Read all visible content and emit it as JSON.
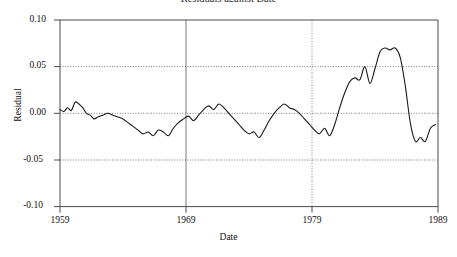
{
  "chart_data": {
    "type": "line",
    "title": "Residuals against Date",
    "xlabel": "Date",
    "ylabel": "Residual",
    "xlim": [
      1959,
      1989
    ],
    "ylim": [
      -0.1,
      0.1
    ],
    "xticks": [
      "1959",
      "1969",
      "1979",
      "1989"
    ],
    "xtick_values": [
      1959,
      1969,
      1979,
      1989
    ],
    "yticks": [
      "0.10",
      "0.05",
      "0.00",
      "-0.05",
      "-0.10"
    ],
    "ytick_values": [
      0.1,
      0.05,
      0.0,
      -0.05,
      -0.1
    ],
    "grid": "horizontal-dotted-and-vertical",
    "legend": "none",
    "line_color": "#1a1a1a",
    "series": [
      {
        "name": "Residual",
        "x": [
          1959.0,
          1959.3,
          1959.6,
          1959.9,
          1960.2,
          1960.5,
          1960.8,
          1961.1,
          1961.4,
          1961.7,
          1962.0,
          1962.4,
          1962.8,
          1963.2,
          1963.6,
          1964.0,
          1964.4,
          1964.8,
          1965.2,
          1965.6,
          1966.0,
          1966.4,
          1966.8,
          1967.2,
          1967.6,
          1968.0,
          1968.4,
          1968.8,
          1969.2,
          1969.6,
          1970.0,
          1970.4,
          1970.8,
          1971.2,
          1971.6,
          1972.0,
          1972.4,
          1972.8,
          1973.2,
          1973.6,
          1974.0,
          1974.4,
          1974.8,
          1975.2,
          1975.6,
          1976.0,
          1976.4,
          1976.8,
          1977.2,
          1977.6,
          1978.0,
          1978.4,
          1978.8,
          1979.2,
          1979.6,
          1980.0,
          1980.4,
          1980.8,
          1981.2,
          1981.6,
          1982.0,
          1982.4,
          1982.8,
          1983.2,
          1983.6,
          1984.0,
          1984.4,
          1984.8,
          1985.2,
          1985.6,
          1986.0,
          1986.4,
          1986.8,
          1987.2,
          1987.6,
          1988.0,
          1988.4,
          1988.8
        ],
        "y": [
          0.004,
          0.002,
          0.006,
          0.003,
          0.012,
          0.01,
          0.006,
          0.0,
          -0.002,
          -0.006,
          -0.004,
          -0.002,
          0.0,
          -0.002,
          -0.004,
          -0.006,
          -0.01,
          -0.014,
          -0.018,
          -0.022,
          -0.02,
          -0.024,
          -0.018,
          -0.02,
          -0.024,
          -0.016,
          -0.01,
          -0.006,
          -0.003,
          -0.008,
          -0.002,
          0.004,
          0.008,
          0.004,
          0.01,
          0.006,
          0.0,
          -0.006,
          -0.012,
          -0.018,
          -0.022,
          -0.02,
          -0.026,
          -0.018,
          -0.008,
          0.0,
          0.006,
          0.01,
          0.006,
          0.004,
          0.0,
          -0.006,
          -0.012,
          -0.018,
          -0.022,
          -0.016,
          -0.024,
          -0.012,
          0.006,
          0.022,
          0.034,
          0.038,
          0.036,
          0.05,
          0.032,
          0.048,
          0.066,
          0.07,
          0.068,
          0.07,
          0.06,
          0.03,
          -0.01,
          -0.03,
          -0.026,
          -0.03,
          -0.016,
          -0.012
        ]
      }
    ]
  }
}
